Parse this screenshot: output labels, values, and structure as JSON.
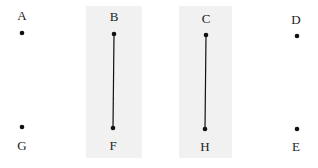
{
  "colors": {
    "background": "#ffffff",
    "panel": "#f1f1f1",
    "ink": "#111111"
  },
  "panels": [
    {
      "id": "panel-left",
      "x": 86,
      "y": 6,
      "w": 56,
      "h": 152
    },
    {
      "id": "panel-right",
      "x": 179,
      "y": 6,
      "w": 53,
      "h": 152
    }
  ],
  "points": [
    {
      "label": "A",
      "x": 22,
      "y": 33,
      "lx": 22,
      "ly": 15
    },
    {
      "label": "B",
      "x": 114,
      "y": 34,
      "lx": 114,
      "ly": 16
    },
    {
      "label": "C",
      "x": 206,
      "y": 35,
      "lx": 206,
      "ly": 18
    },
    {
      "label": "D",
      "x": 297,
      "y": 36,
      "lx": 296,
      "ly": 19
    },
    {
      "label": "E",
      "x": 297,
      "y": 129,
      "lx": 296,
      "ly": 146
    },
    {
      "label": "H",
      "x": 205,
      "y": 129,
      "lx": 205,
      "ly": 146
    },
    {
      "label": "F",
      "x": 113,
      "y": 128,
      "lx": 113,
      "ly": 145
    },
    {
      "label": "G",
      "x": 22,
      "y": 127,
      "lx": 22,
      "ly": 145
    }
  ],
  "segments": [
    {
      "from": "B",
      "to": "F"
    },
    {
      "from": "C",
      "to": "H"
    }
  ]
}
